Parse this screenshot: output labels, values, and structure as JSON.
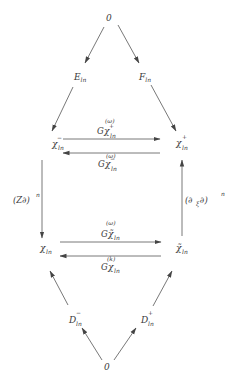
{
  "diagram": {
    "type": "commutative-diagram",
    "nodes": {
      "top_zero": {
        "base": "0",
        "sub": "",
        "sup": ""
      },
      "E": {
        "base": "E",
        "sub": "ln",
        "sup": ""
      },
      "F": {
        "base": "F",
        "sub": "ln",
        "sup": ""
      },
      "chi_minus": {
        "base": "χ",
        "sub": "ln",
        "sup": "−"
      },
      "chi_plus": {
        "base": "χ",
        "sub": "ln",
        "sup": "+"
      },
      "chi": {
        "base": "χ",
        "sub": "ln",
        "sup": ""
      },
      "chi_tilde": {
        "base": "χ̃",
        "sub": "ln",
        "sup": ""
      },
      "D_minus": {
        "base": "D",
        "sub": "ln",
        "sup": "−"
      },
      "D_plus": {
        "base": "D",
        "sub": "ln",
        "sup": "+"
      },
      "bottom_zero": {
        "base": "0",
        "sub": "",
        "sup": ""
      }
    },
    "edge_labels": {
      "G_chi_plus": {
        "base": "G",
        "inner": "χ",
        "inner_sup": "+",
        "inner_sub": "ln",
        "sup": "(ω)"
      },
      "G_chi_minus": {
        "base": "G",
        "inner": "χ",
        "inner_sup": "−",
        "inner_sub": "ln",
        "sup": "(ω)"
      },
      "G_chi_tilde": {
        "base": "G",
        "inner": "χ̃",
        "inner_sup": "",
        "inner_sub": "ln",
        "sup": "(ω)"
      },
      "G_chi": {
        "base": "G",
        "inner": "χ",
        "inner_sup": "",
        "inner_sub": "ln",
        "sup": "(k)"
      },
      "left_vertical": {
        "text": "(Z∂)",
        "sup": "n"
      },
      "right_vertical": {
        "text": "(∂",
        "sub": "ξ",
        "text2": " ∂)",
        "sup": "n"
      }
    },
    "edges": [
      {
        "from": "top_zero",
        "to": "E"
      },
      {
        "from": "top_zero",
        "to": "F"
      },
      {
        "from": "E",
        "to": "chi_minus"
      },
      {
        "from": "F",
        "to": "chi_plus"
      },
      {
        "from": "chi_minus",
        "to": "chi_plus",
        "label": "G_chi_plus"
      },
      {
        "from": "chi_plus",
        "to": "chi_minus",
        "label": "G_chi_minus"
      },
      {
        "from": "chi_minus",
        "to": "chi",
        "label": "left_vertical"
      },
      {
        "from": "chi_tilde",
        "to": "chi_plus",
        "label": "right_vertical"
      },
      {
        "from": "chi",
        "to": "chi_tilde",
        "label": "G_chi_tilde"
      },
      {
        "from": "chi_tilde",
        "to": "chi",
        "label": "G_chi"
      },
      {
        "from": "D_minus",
        "to": "chi"
      },
      {
        "from": "D_plus",
        "to": "chi_tilde"
      },
      {
        "from": "bottom_zero",
        "to": "D_minus"
      },
      {
        "from": "bottom_zero",
        "to": "D_plus"
      }
    ],
    "colors": {
      "ink": "#3a3a3a",
      "line": "#555555",
      "background": "#ffffff"
    }
  }
}
